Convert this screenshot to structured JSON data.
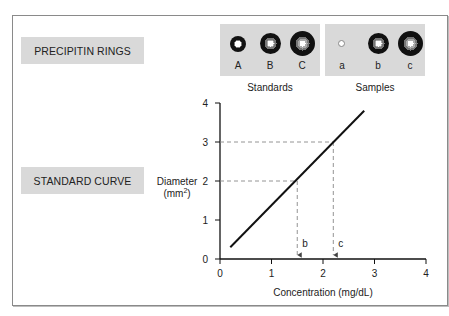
{
  "labels": {
    "precipitin_rings": "PRECIPITIN RINGS",
    "standard_curve": "STANDARD CURVE"
  },
  "rings": {
    "standards": {
      "caption": "Standards",
      "items": [
        {
          "label": "A",
          "relative_size": "small"
        },
        {
          "label": "B",
          "relative_size": "medium"
        },
        {
          "label": "C",
          "relative_size": "large"
        }
      ]
    },
    "samples": {
      "caption": "Samples",
      "items": [
        {
          "label": "a",
          "relative_size": "none"
        },
        {
          "label": "b",
          "relative_size": "medium"
        },
        {
          "label": "c",
          "relative_size": "large"
        }
      ]
    }
  },
  "colors": {
    "panel_bg": "#d9d9d9",
    "ring_dark": "#111111",
    "ring_mid": "#777777",
    "ring_core": "#ffffff",
    "line": "#111111",
    "guide": "#888888"
  },
  "chart_data": {
    "type": "line",
    "title": "",
    "xlabel": "Concentration (mg/dL)",
    "ylabel_line1": "Diameter",
    "ylabel_line2": "(mm",
    "ylabel_sup": "2",
    "ylabel_close": ")",
    "xlim": [
      0,
      4
    ],
    "ylim": [
      0,
      4
    ],
    "xticks": [
      0,
      1,
      2,
      3,
      4
    ],
    "yticks": [
      0,
      1,
      2,
      3,
      4
    ],
    "grid": false,
    "series": [
      {
        "name": "standard curve",
        "x": [
          0.2,
          2.8
        ],
        "y": [
          0.3,
          3.8
        ]
      }
    ],
    "guides": [
      {
        "label": "b",
        "y": 2,
        "x": 1.5
      },
      {
        "label": "c",
        "y": 3,
        "x": 2.2
      }
    ]
  }
}
